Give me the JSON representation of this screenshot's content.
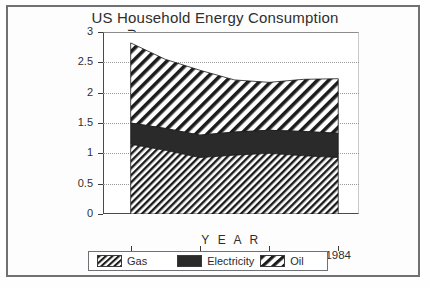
{
  "chart_data": {
    "type": "area",
    "title": "US Household Energy Consumption",
    "xlabel": "Y E A R",
    "ylabel": "Quadrillion BTU",
    "xlim": [
      1977.2,
      1984.6
    ],
    "ylim": [
      0,
      3
    ],
    "grid": true,
    "stacked": true,
    "legend_position": "bottom",
    "x": [
      1978,
      1979,
      1980,
      1981,
      1982,
      1983,
      1984
    ],
    "xticks": [
      "1978",
      "1980",
      "1982",
      "1984"
    ],
    "xtick_values": [
      1978,
      1980,
      1982,
      1984
    ],
    "yticks": [
      "0",
      "0.5",
      "1",
      "1.5",
      "2",
      "2.5",
      "3"
    ],
    "ytick_values": [
      0,
      0.5,
      1,
      1.5,
      2,
      2.5,
      3
    ],
    "series": [
      {
        "name": "Gas",
        "fill": "dense-diagonal-hatch",
        "values": [
          1.15,
          1.05,
          0.93,
          0.97,
          1.0,
          0.96,
          0.93
        ]
      },
      {
        "name": "Electricity",
        "fill": "solid-black",
        "values": [
          0.35,
          0.36,
          0.37,
          0.38,
          0.38,
          0.4,
          0.4
        ]
      },
      {
        "name": "Oil",
        "fill": "wide-diagonal-hatch",
        "values": [
          1.32,
          1.14,
          1.07,
          0.86,
          0.79,
          0.86,
          0.9
        ]
      }
    ],
    "cumulative_tops": {
      "gas": [
        1.15,
        1.05,
        0.93,
        0.97,
        1.0,
        0.96,
        0.93
      ],
      "electricity": [
        1.5,
        1.41,
        1.3,
        1.35,
        1.38,
        1.36,
        1.33
      ],
      "oil": [
        2.82,
        2.55,
        2.37,
        2.21,
        2.17,
        2.22,
        2.23
      ]
    }
  },
  "legend": {
    "items": [
      {
        "label": "Gas"
      },
      {
        "label": "Electricity"
      },
      {
        "label": "Oil"
      }
    ]
  },
  "colors": {
    "hatch": "#1c1c1c",
    "solid": "#2a2a2a",
    "frame": "#6f7174",
    "axis": "#3b3b3b",
    "grid": "#9a9a9a",
    "background": "#ffffff"
  }
}
